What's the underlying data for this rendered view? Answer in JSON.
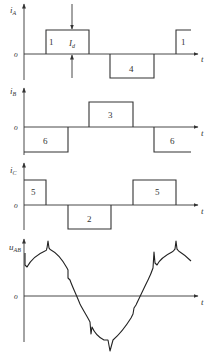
{
  "diagram": {
    "panels": [
      {
        "id": "iA",
        "ylabel_main": "i",
        "ylabel_sub": "A",
        "zero_label": "o",
        "xlabel": "t",
        "pulses": [
          {
            "label": "1",
            "polarity": "positive"
          },
          {
            "label": "4",
            "polarity": "negative"
          },
          {
            "label": "1",
            "polarity": "positive"
          }
        ],
        "annotation_main": "I",
        "annotation_sub": "d"
      },
      {
        "id": "iB",
        "ylabel_main": "i",
        "ylabel_sub": "B",
        "zero_label": "o",
        "xlabel": "t",
        "pulses": [
          {
            "label": "6",
            "polarity": "negative"
          },
          {
            "label": "3",
            "polarity": "positive"
          },
          {
            "label": "6",
            "polarity": "negative"
          }
        ]
      },
      {
        "id": "iC",
        "ylabel_main": "i",
        "ylabel_sub": "C",
        "zero_label": "o",
        "xlabel": "t",
        "pulses": [
          {
            "label": "5",
            "polarity": "positive"
          },
          {
            "label": "2",
            "polarity": "negative"
          },
          {
            "label": "5",
            "polarity": "positive"
          }
        ]
      },
      {
        "id": "uAB",
        "ylabel_main": "u",
        "ylabel_sub": "AB",
        "zero_label": "o",
        "xlabel": "t",
        "waveform": "sinusoid with commutation notches/spikes"
      }
    ]
  }
}
